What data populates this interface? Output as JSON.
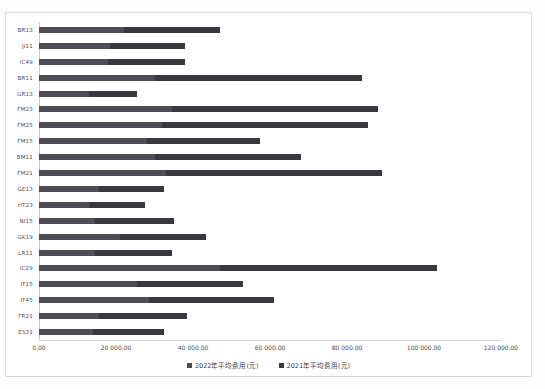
{
  "chart_data": {
    "type": "bar",
    "orientation": "horizontal",
    "stacked": true,
    "title": "",
    "xlabel": "",
    "ylabel": "",
    "grid": false,
    "legend_position": "bottom-center",
    "x_axis": {
      "min": 0,
      "max": 120000,
      "tick_labels": [
        "0.00",
        "20 000.00",
        "40 000.00",
        "60 000.00",
        "80 000.00",
        "100 000.00",
        "120 000.00"
      ],
      "tick_values": [
        0,
        20000,
        40000,
        60000,
        80000,
        100000,
        120000
      ]
    },
    "categories": [
      "BR13",
      "JI11",
      "IC49",
      "BR11",
      "GR13",
      "FM23",
      "FM25",
      "FM15",
      "BM11",
      "FM21",
      "GE13",
      "HT23",
      "NI15",
      "GK19",
      "LR11",
      "IC29",
      "IF15",
      "IF45",
      "FR21",
      "ES31"
    ],
    "series": [
      {
        "name": "2022年平均费用(元)",
        "color": "#4d4d54",
        "values": [
          22000,
          18500,
          18000,
          30000,
          13000,
          34500,
          32000,
          28000,
          30000,
          33000,
          15500,
          13000,
          14500,
          21000,
          14500,
          47000,
          25500,
          28500,
          15500,
          14000
        ]
      },
      {
        "name": "2021年平均费用(元)",
        "color": "#38383d",
        "values": [
          25000,
          19500,
          20000,
          54000,
          12500,
          53500,
          53500,
          29500,
          38000,
          56000,
          17000,
          14500,
          20500,
          22500,
          20000,
          56500,
          27500,
          32500,
          23000,
          18500
        ]
      }
    ],
    "colors": {
      "frame_border": "#d9d9d9",
      "axis_line": "#c9c9c9",
      "background": "#ffffff"
    }
  }
}
